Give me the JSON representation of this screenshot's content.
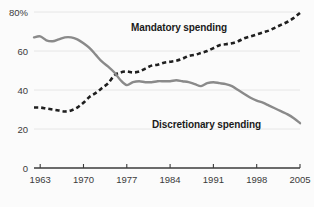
{
  "chart_data": {
    "type": "line",
    "title": "",
    "subtitle": "",
    "xlabel": "",
    "ylabel": "",
    "xlim": [
      1962,
      2005
    ],
    "ylim": [
      0,
      80
    ],
    "grid": true,
    "grid_axis": "y",
    "legend_position": "inline-annotations",
    "x_tick_labels": [
      "1963",
      "1970",
      "1977",
      "1984",
      "1991",
      "1998",
      "2005"
    ],
    "x_tick_values": [
      1963,
      1970,
      1977,
      1984,
      1991,
      1998,
      2005
    ],
    "y_tick_labels": [
      "80%",
      "60",
      "40",
      "20",
      "0"
    ],
    "y_tick_values": [
      80,
      60,
      40,
      20,
      0
    ],
    "series": [
      {
        "name": "Mandatory spending",
        "style": "dashed",
        "color": "#1f1f1f",
        "label_text": "Mandatory spending",
        "x": [
          1962,
          1963,
          1964,
          1965,
          1966,
          1967,
          1968,
          1969,
          1970,
          1971,
          1972,
          1973,
          1974,
          1975,
          1976,
          1977,
          1978,
          1979,
          1980,
          1981,
          1982,
          1983,
          1984,
          1985,
          1986,
          1987,
          1988,
          1989,
          1990,
          1991,
          1992,
          1993,
          1994,
          1995,
          1996,
          1997,
          1998,
          1999,
          2000,
          2001,
          2002,
          2003,
          2004,
          2005
        ],
        "values": [
          31,
          31,
          30.5,
          30,
          29.5,
          29,
          29.5,
          31,
          33.5,
          36.5,
          38.5,
          41,
          43.5,
          47.5,
          49,
          49.5,
          49,
          49.5,
          51,
          52.5,
          53,
          54,
          54.5,
          55,
          56,
          57.5,
          58,
          59,
          60,
          61.5,
          63,
          63.5,
          64,
          65,
          66.5,
          67.5,
          68.5,
          69.5,
          70.5,
          72,
          73.5,
          75,
          77,
          79.5
        ]
      },
      {
        "name": "Discretionary spending",
        "style": "solid",
        "color": "#8a8a8a",
        "label_text": "Discretionary spending",
        "x": [
          1962,
          1963,
          1964,
          1965,
          1966,
          1967,
          1968,
          1969,
          1970,
          1971,
          1972,
          1973,
          1974,
          1975,
          1976,
          1977,
          1978,
          1979,
          1980,
          1981,
          1982,
          1983,
          1984,
          1985,
          1986,
          1987,
          1988,
          1989,
          1990,
          1991,
          1992,
          1993,
          1994,
          1995,
          1996,
          1997,
          1998,
          1999,
          2000,
          2001,
          2002,
          2003,
          2004,
          2005
        ],
        "values": [
          67,
          67.5,
          65.5,
          65,
          66,
          67,
          67,
          66,
          64,
          61.5,
          58,
          54.5,
          52,
          49,
          45,
          42.5,
          44,
          44.5,
          44,
          44,
          44.5,
          44.5,
          44.5,
          45,
          44.5,
          44,
          43,
          42,
          43.5,
          44,
          43.5,
          43,
          42,
          40,
          38,
          36,
          34.5,
          33.5,
          32,
          30.5,
          29,
          27.5,
          25.5,
          23
        ]
      }
    ]
  },
  "annotations": {
    "mandatory": {
      "text": "Mandatory spending",
      "x": 131,
      "y": 31
    },
    "discretionary": {
      "text": "Discretionary spending",
      "x": 152,
      "y": 128
    }
  },
  "colors": {
    "background": "#fbfbfb",
    "axis": "#3b3b3b",
    "grid": "#e2e2e2",
    "solid_series": "#8a8a8a",
    "dashed_series": "#1f1f1f",
    "tick_text": "#3a3a3a",
    "annotation_text": "#1a1a1a"
  }
}
